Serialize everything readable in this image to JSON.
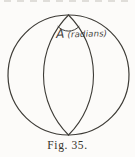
{
  "colors": {
    "ink": "#3d3b36",
    "label_ink": "#44413b",
    "caption_ink": "#35322b",
    "paper": "#fcfbf9",
    "bleed": "#c9c6c0"
  },
  "figure": {
    "angle_label": "A (radians)",
    "caption": "Fig. 35."
  }
}
